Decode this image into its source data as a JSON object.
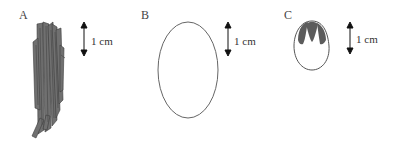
{
  "figure": {
    "panels": [
      {
        "label": "A",
        "scale_text": "1 cm",
        "shape": "fibrous-bundle",
        "fill": "#6e6e6e"
      },
      {
        "label": "B",
        "scale_text": "1 cm",
        "shape": "oval-outline",
        "fill": "none"
      },
      {
        "label": "C",
        "scale_text": "1 cm",
        "shape": "egg-with-dark-cap",
        "fill": "#5c5c5c"
      }
    ]
  }
}
